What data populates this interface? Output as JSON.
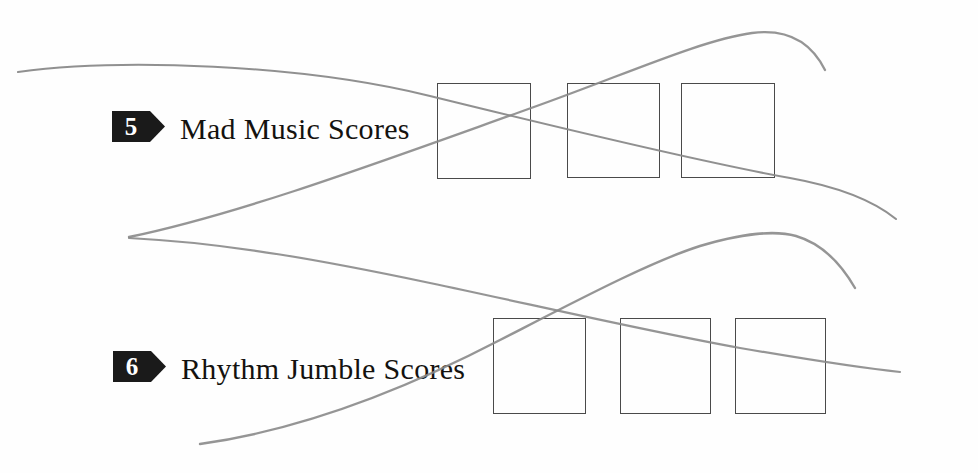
{
  "page": {
    "width": 978,
    "height": 473,
    "background_color": "#fefefe",
    "ink_color": "#14120f",
    "badge_color": "#1a1a1a",
    "badge_number_color": "#ffffff",
    "box_border_color": "#4a4a4a",
    "artifact_color": "#8a8a8a"
  },
  "sections": [
    {
      "number": "5",
      "title": "Mad Music Scores",
      "badge": {
        "x": 112,
        "y": 111,
        "width": 53,
        "height": 31,
        "point_width": 15
      },
      "title_pos": {
        "x": 180,
        "y": 112
      },
      "answer_boxes": [
        {
          "x": 437,
          "y": 83,
          "width": 94,
          "height": 96
        },
        {
          "x": 567,
          "y": 83,
          "width": 93,
          "height": 95
        },
        {
          "x": 681,
          "y": 83,
          "width": 94,
          "height": 95
        }
      ]
    },
    {
      "number": "6",
      "title": "Rhythm Jumble Scores",
      "badge": {
        "x": 113,
        "y": 351,
        "width": 53,
        "height": 31,
        "point_width": 15
      },
      "title_pos": {
        "x": 181,
        "y": 352
      },
      "answer_boxes": [
        {
          "x": 493,
          "y": 318,
          "width": 93,
          "height": 96
        },
        {
          "x": 620,
          "y": 318,
          "width": 91,
          "height": 96
        },
        {
          "x": 735,
          "y": 318,
          "width": 91,
          "height": 96
        }
      ]
    }
  ],
  "artifacts": {
    "description": "gray scanner/binding shadow curves overlaying the page",
    "curves": [
      {
        "name": "upper-descending-curve",
        "path": "M 18,72 C 120,58 300,64 430,96 C 560,128 700,162 790,178 C 840,187 875,202 896,219"
      },
      {
        "name": "upper-ascending-curve",
        "path": "M 129,237 C 240,214 380,162 520,112 C 620,77 700,40 752,33 C 790,28 812,44 825,70"
      },
      {
        "name": "lower-descending-curve",
        "path": "M 129,238 C 230,243 330,262 430,283 C 530,304 640,330 740,348 C 810,360 860,368 900,372"
      },
      {
        "name": "lower-ascending-curve",
        "path": "M 200,444 C 300,430 400,392 500,340 C 580,299 650,262 700,246 C 740,234 775,230 796,236 C 820,243 840,262 855,288"
      }
    ]
  }
}
